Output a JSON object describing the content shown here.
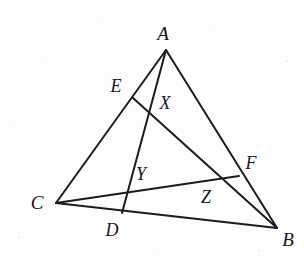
{
  "figure": {
    "type": "geometry-diagram",
    "width": 304,
    "height": 267,
    "background_color": "#fdfdfd",
    "stroke_color": "#1b1b20",
    "stroke_width": 2,
    "label_color": "#16161a"
  },
  "points": {
    "A": {
      "label": "A",
      "x": 166,
      "y": 50,
      "label_x": 163,
      "label_y": 33,
      "kind": "vertex"
    },
    "B": {
      "label": "B",
      "x": 277,
      "y": 228,
      "label_x": 288,
      "label_y": 239,
      "kind": "vertex"
    },
    "C": {
      "label": "C",
      "x": 56,
      "y": 203,
      "label_x": 37,
      "label_y": 202,
      "kind": "vertex"
    },
    "D": {
      "label": "D",
      "x": 122,
      "y": 213,
      "label_x": 112,
      "label_y": 230,
      "kind": "side-point"
    },
    "E": {
      "label": "E",
      "x": 133,
      "y": 98,
      "label_x": 116,
      "label_y": 86,
      "kind": "side-point"
    },
    "F": {
      "label": "F",
      "x": 239,
      "y": 176,
      "label_x": 251,
      "label_y": 163,
      "kind": "side-point"
    },
    "X": {
      "label": "X",
      "x": 150,
      "y": 108,
      "label_x": 165,
      "label_y": 103,
      "kind": "intersection"
    },
    "Y": {
      "label": "Y",
      "x": 126,
      "y": 192,
      "label_x": 141,
      "label_y": 174,
      "kind": "intersection"
    },
    "Z": {
      "label": "Z",
      "x": 215,
      "y": 177,
      "label_x": 206,
      "label_y": 197,
      "kind": "intersection"
    }
  },
  "segments": [
    {
      "name": "side-AC",
      "from": "A",
      "to": "C"
    },
    {
      "name": "side-AB",
      "from": "A",
      "to": "B"
    },
    {
      "name": "side-CB",
      "from": "C",
      "to": "B"
    },
    {
      "name": "cevian-AD",
      "from": "A",
      "to": "D"
    },
    {
      "name": "cevian-BE",
      "from": "B",
      "to": "E"
    },
    {
      "name": "cevian-CF",
      "from": "C",
      "to": "F"
    }
  ]
}
